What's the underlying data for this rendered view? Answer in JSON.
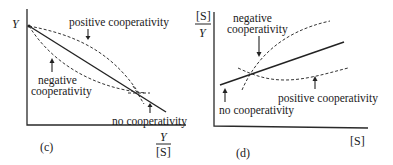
{
  "panel_c": {
    "tag": "(c)",
    "y_axis_label": "Y",
    "x_axis_label_num": "Y",
    "x_axis_label_den": "[S]",
    "labels": {
      "positive": "positive cooperativity",
      "negative_line1": "negative",
      "negative_line2": "cooperativity",
      "none": "no cooperativity"
    }
  },
  "panel_d": {
    "tag": "(d)",
    "y_axis_label_num": "[S]",
    "y_axis_label_den": "Y",
    "x_axis_label": "[S]",
    "labels": {
      "negative_line1": "negative",
      "negative_line2": "cooperativity",
      "positive": "positive cooperativity",
      "none": "no cooperativity"
    }
  }
}
